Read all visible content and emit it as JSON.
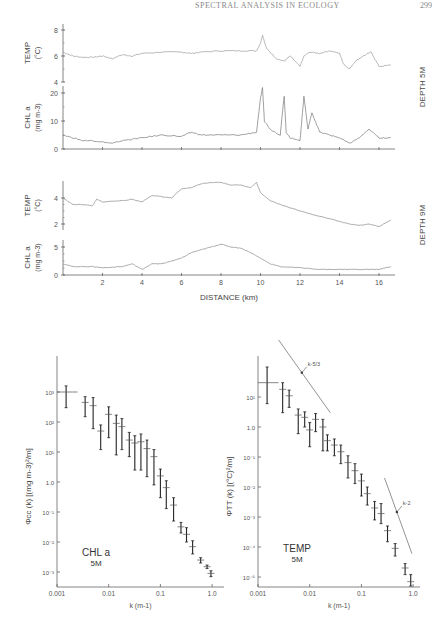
{
  "header": {
    "running_title": "SPECTRAL ANALYSIS IN ECOLOGY",
    "page_number": "299"
  },
  "chart_data": [
    {
      "type": "line",
      "title": "Depth 5M transects",
      "panel_label": "DEPTH 5M",
      "xlabel": "DISTANCE (km)",
      "x_ticks": [
        0,
        2,
        4,
        6,
        8,
        10,
        12,
        14,
        16
      ],
      "xlim": [
        0,
        16.6
      ],
      "series": [
        {
          "name": "TEMP",
          "ylabel": "TEMP (°C)",
          "ylim": [
            4,
            8.5
          ],
          "y_ticks": [
            4,
            6,
            8
          ],
          "x": [
            0,
            0.5,
            1,
            1.5,
            2,
            2.5,
            3,
            3.5,
            4,
            5,
            6,
            6.5,
            7,
            8,
            9,
            9.8,
            10,
            10.1,
            10.3,
            10.8,
            11.2,
            11.5,
            12,
            12.2,
            12.5,
            13,
            13.5,
            14,
            14.2,
            14.5,
            14.8,
            15.2,
            15.6,
            16,
            16.6
          ],
          "values": [
            6.3,
            6.0,
            5.9,
            5.9,
            6.0,
            5.8,
            6.1,
            6.0,
            6.2,
            6.3,
            6.3,
            6.2,
            6.3,
            6.4,
            6.4,
            6.4,
            7.0,
            7.6,
            6.6,
            5.8,
            5.6,
            6.0,
            5.2,
            6.0,
            6.3,
            6.2,
            6.4,
            6.2,
            5.4,
            5.0,
            5.6,
            6.0,
            6.3,
            5.2,
            5.3
          ]
        },
        {
          "name": "CHL a",
          "ylabel": "CHL a (mg m-3)",
          "ylim": [
            0,
            22
          ],
          "y_ticks": [
            0,
            10,
            20
          ],
          "x": [
            0,
            0.5,
            1,
            1.5,
            2,
            2.5,
            3,
            3.5,
            4,
            5,
            6,
            6.5,
            7,
            8,
            9,
            9.8,
            10,
            10.1,
            10.2,
            10.5,
            11,
            11.2,
            11.3,
            11.5,
            12,
            12.2,
            12.4,
            12.6,
            13,
            13.5,
            14,
            14.5,
            15,
            15.5,
            16,
            16.6
          ],
          "values": [
            5,
            4,
            3,
            3,
            2.5,
            2,
            3,
            3.5,
            4,
            5,
            4.5,
            6,
            5,
            5,
            5,
            6,
            18,
            22,
            10,
            7,
            5,
            19,
            6,
            4,
            3,
            19,
            7,
            13,
            6,
            5,
            4,
            2,
            4,
            7,
            4,
            4
          ]
        }
      ]
    },
    {
      "type": "line",
      "title": "Depth 9M transects",
      "panel_label": "DEPTH 9M",
      "xlabel": "DISTANCE (km)",
      "x_ticks": [
        2,
        4,
        6,
        8,
        10,
        12,
        14,
        16
      ],
      "xlim": [
        0,
        16.6
      ],
      "series": [
        {
          "name": "TEMP",
          "ylabel": "TEMP (°C)",
          "ylim": [
            1.5,
            5.5
          ],
          "y_ticks": [
            2,
            4
          ],
          "x": [
            0,
            0.5,
            1,
            1.5,
            1.7,
            2,
            3,
            3.5,
            4,
            4.5,
            5,
            5.5,
            6,
            6.5,
            7,
            7.5,
            8,
            8.5,
            9,
            9.5,
            9.8,
            10,
            10.5,
            11,
            12,
            13,
            14,
            14.5,
            15,
            15.5,
            16,
            16.6
          ],
          "values": [
            4.0,
            3.5,
            3.5,
            3.4,
            3.9,
            3.7,
            3.8,
            3.9,
            3.7,
            4.2,
            4.1,
            4.0,
            4.7,
            4.8,
            5.1,
            5.2,
            5.2,
            5.0,
            5.0,
            4.8,
            5.2,
            4.4,
            3.8,
            3.5,
            3.0,
            2.6,
            2.2,
            2.0,
            1.9,
            2.0,
            1.8,
            2.3
          ]
        },
        {
          "name": "CHL a",
          "ylabel": "CHL a (mg m-3)",
          "ylim": [
            0,
            6
          ],
          "y_ticks": [
            0,
            5
          ],
          "x": [
            0,
            0.5,
            1,
            1.5,
            2,
            3,
            3.5,
            4,
            4.5,
            5,
            5.5,
            6,
            6.5,
            7,
            7.5,
            8,
            8.5,
            9,
            9.5,
            10,
            10.5,
            11,
            12,
            13,
            14,
            15,
            16,
            16.6
          ],
          "values": [
            2,
            1.5,
            1.5,
            1.5,
            1.3,
            1.5,
            2.0,
            1.0,
            2.0,
            2.0,
            2.5,
            3.0,
            4.0,
            4.5,
            5.0,
            5.5,
            5.0,
            4.8,
            4.0,
            3.0,
            2.0,
            1.5,
            1.3,
            1.0,
            1.0,
            1.0,
            1.0,
            1.5
          ]
        }
      ]
    },
    {
      "type": "scatter",
      "title": "CHL a spectrum",
      "annotation": [
        "CHL a",
        "5M"
      ],
      "xlabel": "k (m-1)",
      "ylabel": "Φcc(k) [(mg m-3)² / m]",
      "xscale": "log",
      "yscale": "log",
      "x_ticks": [
        "0.001",
        "0.01",
        "0.1",
        "1.0"
      ],
      "y_ticks": [
        "10^3",
        "10^2",
        "10^1",
        "1.0",
        "10^-1",
        "10^-2",
        "10^-3"
      ],
      "points": [
        {
          "k": 0.0015,
          "y": 1000,
          "lo": 300,
          "hi": 1600,
          "xlo": 0.001,
          "xhi": 0.0025
        },
        {
          "k": 0.0035,
          "y": 450,
          "lo": 150,
          "hi": 700
        },
        {
          "k": 0.005,
          "y": 350,
          "lo": 60,
          "hi": 650
        },
        {
          "k": 0.007,
          "y": 50,
          "lo": 12,
          "hi": 80
        },
        {
          "k": 0.01,
          "y": 180,
          "lo": 30,
          "hi": 320
        },
        {
          "k": 0.014,
          "y": 90,
          "lo": 8,
          "hi": 170
        },
        {
          "k": 0.018,
          "y": 70,
          "lo": 12,
          "hi": 130
        },
        {
          "k": 0.025,
          "y": 25,
          "lo": 7,
          "hi": 45
        },
        {
          "k": 0.032,
          "y": 20,
          "lo": 2.5,
          "hi": 35
        },
        {
          "k": 0.042,
          "y": 22,
          "lo": 2.5,
          "hi": 40
        },
        {
          "k": 0.055,
          "y": 13,
          "lo": 1.5,
          "hi": 25
        },
        {
          "k": 0.075,
          "y": 7,
          "lo": 0.8,
          "hi": 12
        },
        {
          "k": 0.1,
          "y": 1.6,
          "lo": 0.3,
          "hi": 2.7
        },
        {
          "k": 0.13,
          "y": 0.65,
          "lo": 0.13,
          "hi": 1.1
        },
        {
          "k": 0.18,
          "y": 0.17,
          "lo": 0.05,
          "hi": 0.3
        },
        {
          "k": 0.25,
          "y": 0.032,
          "lo": 0.02,
          "hi": 0.045
        },
        {
          "k": 0.32,
          "y": 0.018,
          "lo": 0.01,
          "hi": 0.03
        },
        {
          "k": 0.42,
          "y": 0.007,
          "lo": 0.004,
          "hi": 0.011
        },
        {
          "k": 0.6,
          "y": 0.0025,
          "lo": 0.002,
          "hi": 0.003
        },
        {
          "k": 0.8,
          "y": 0.0015,
          "lo": 0.0013,
          "hi": 0.0017
        },
        {
          "k": 0.95,
          "y": 0.0009,
          "lo": 0.0007,
          "hi": 0.0011
        }
      ]
    },
    {
      "type": "scatter",
      "title": "TEMP spectrum",
      "annotation": [
        "TEMP",
        "5M"
      ],
      "xlabel": "k (m-1)",
      "ylabel": "ΦTT(k) [(°C)² / m]",
      "xscale": "log",
      "yscale": "log",
      "x_ticks": [
        "0.001",
        "0.01",
        "0.1",
        "1.0"
      ],
      "y_ticks": [
        "10^1",
        "1.0",
        "10^-1",
        "10^-2",
        "10^-3",
        "10^-4",
        "10^-5"
      ],
      "reference_slopes": [
        {
          "label": "k^-5/3",
          "from": [
            0.0025,
            800
          ],
          "to": [
            0.025,
            3
          ]
        },
        {
          "label": "k^-2",
          "from": [
            0.28,
            0.02
          ],
          "to": [
            0.95,
            6e-05
          ]
        }
      ],
      "points": [
        {
          "k": 0.0015,
          "y": 30,
          "lo": 6,
          "hi": 100,
          "xlo": 0.001,
          "xhi": 0.0025
        },
        {
          "k": 0.003,
          "y": 18,
          "lo": 3,
          "hi": 30
        },
        {
          "k": 0.004,
          "y": 11,
          "lo": 4.5,
          "hi": 17
        },
        {
          "k": 0.006,
          "y": 2.5,
          "lo": 0.6,
          "hi": 4
        },
        {
          "k": 0.008,
          "y": 2.1,
          "lo": 1.0,
          "hi": 3.2
        },
        {
          "k": 0.01,
          "y": 0.8,
          "lo": 0.22,
          "hi": 1.4
        },
        {
          "k": 0.013,
          "y": 1.8,
          "lo": 0.7,
          "hi": 2.8
        },
        {
          "k": 0.018,
          "y": 1.0,
          "lo": 0.16,
          "hi": 1.8
        },
        {
          "k": 0.022,
          "y": 0.35,
          "lo": 0.16,
          "hi": 0.55
        },
        {
          "k": 0.03,
          "y": 0.25,
          "lo": 0.11,
          "hi": 0.4
        },
        {
          "k": 0.04,
          "y": 0.15,
          "lo": 0.06,
          "hi": 0.25
        },
        {
          "k": 0.055,
          "y": 0.065,
          "lo": 0.02,
          "hi": 0.11
        },
        {
          "k": 0.075,
          "y": 0.035,
          "lo": 0.013,
          "hi": 0.06
        },
        {
          "k": 0.1,
          "y": 0.016,
          "lo": 0.005,
          "hi": 0.027
        },
        {
          "k": 0.13,
          "y": 0.006,
          "lo": 0.0025,
          "hi": 0.01
        },
        {
          "k": 0.18,
          "y": 0.002,
          "lo": 0.0008,
          "hi": 0.0033
        },
        {
          "k": 0.24,
          "y": 0.0013,
          "lo": 0.0006,
          "hi": 0.0028
        },
        {
          "k": 0.32,
          "y": 0.00035,
          "lo": 0.00015,
          "hi": 0.0005
        },
        {
          "k": 0.45,
          "y": 9e-05,
          "lo": 5e-05,
          "hi": 0.00013
        },
        {
          "k": 0.7,
          "y": 2e-05,
          "lo": 1.2e-05,
          "hi": 2.8e-05
        },
        {
          "k": 0.9,
          "y": 7e-06,
          "lo": 5e-06,
          "hi": 1.2e-05
        }
      ]
    }
  ],
  "labels": {
    "temp": "TEMP",
    "temp_unit": "(°C)",
    "chl": "CHL a",
    "chl_unit": "(mg m-3)",
    "depth5": "DEPTH 5M",
    "depth9": "DEPTH 9M",
    "distance": "DISTANCE (km)",
    "k_axis": "k (m-1)",
    "phi_cc": "Φcc (k) [(mg m-3)²/m]",
    "phi_tt": "ΦTT (k) [(°C)²/m]",
    "spec_left_label": "CHL a",
    "spec_left_depth": "5M",
    "spec_right_label": "TEMP",
    "spec_right_depth": "5M",
    "slope_a": "k-5/3",
    "slope_b": "k-2",
    "xk_ticks": [
      "0.001",
      "0.01",
      "0.1",
      "1.0"
    ],
    "left_y_ticks": [
      "10³",
      "10²",
      "10¹",
      "1.0",
      "10⁻¹",
      "10⁻²",
      "10⁻³"
    ],
    "right_y_ticks": [
      "10¹",
      "1.0",
      "10⁻¹",
      "10⁻²",
      "10⁻³",
      "10⁻⁴",
      "10⁻⁵"
    ]
  }
}
